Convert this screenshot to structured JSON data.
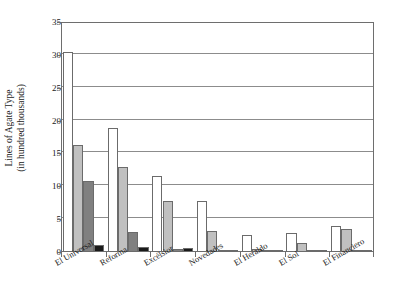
{
  "chart_data": {
    "type": "bar",
    "title": "",
    "subtitle": "",
    "xlabel": "",
    "ylabel": "Lines of Agate Type (in hundred thousands)",
    "ylabel_lines": [
      "Lines of Agate Type",
      "(in hundred thousands)"
    ],
    "categories": [
      "El Universal",
      "Reforma",
      "Excélsior",
      "Novedades",
      "El Heraldo",
      "El Sol",
      "El Financiero"
    ],
    "ylim": [
      0,
      35
    ],
    "yticks": [
      0,
      5,
      10,
      15,
      20,
      25,
      30,
      35
    ],
    "ytick_labels": [
      "0",
      "5",
      "10",
      "15",
      "20",
      "25",
      "30",
      "35"
    ],
    "grid": true,
    "grid_axis": "y",
    "legend": false,
    "legend_position": "none",
    "series": [
      {
        "name": "Series 1",
        "color": "#ffffff",
        "values": [
          30.5,
          18.9,
          11.5,
          7.8,
          2.6,
          2.9,
          3.9
        ]
      },
      {
        "name": "Series 2",
        "color": "#c0c0c0",
        "values": [
          16.3,
          13.0,
          7.7,
          3.2,
          0.4,
          1.3,
          3.5
        ]
      },
      {
        "name": "Series 3",
        "color": "#808080",
        "values": [
          10.8,
          3.0,
          0.5,
          0.2,
          0.2,
          0.2,
          0.3
        ]
      },
      {
        "name": "Series 4",
        "color": "#1a1a1a",
        "values": [
          1.1,
          0.8,
          0.6,
          0.3,
          0.2,
          0.2,
          0.25
        ]
      }
    ]
  }
}
